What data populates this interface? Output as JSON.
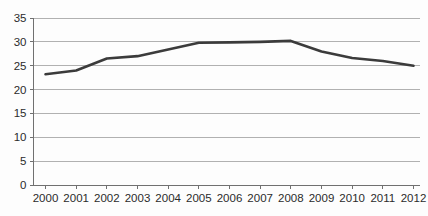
{
  "chart_data": {
    "type": "line",
    "title": "",
    "subtitle": "",
    "xlabel": "",
    "ylabel": "",
    "categories": [
      "2000",
      "2001",
      "2002",
      "2003",
      "2004",
      "2005",
      "2006",
      "2007",
      "2008",
      "2009",
      "2010",
      "2011",
      "2012"
    ],
    "x": [
      2000,
      2001,
      2002,
      2003,
      2004,
      2005,
      2006,
      2007,
      2008,
      2009,
      2010,
      2011,
      2012
    ],
    "series": [
      {
        "name": "",
        "values": [
          23.2,
          24.0,
          26.5,
          27.0,
          28.4,
          29.8,
          29.9,
          30.0,
          30.2,
          28.0,
          26.6,
          26.0,
          25.0
        ],
        "color": "#3b3b3b",
        "line_width": 2.6
      }
    ],
    "ylim": [
      0,
      35
    ],
    "yticks": [
      0,
      5,
      10,
      15,
      20,
      25,
      30,
      35
    ],
    "ytick_labels": [
      "0",
      "5",
      "10",
      "15",
      "20",
      "25",
      "30",
      "35"
    ],
    "xtick_labels": [
      "2000",
      "2001",
      "2002",
      "2003",
      "2004",
      "2005",
      "2006",
      "2007",
      "2008",
      "2009",
      "2010",
      "2011",
      "2012"
    ],
    "grid": true,
    "grid_axis": "y",
    "grid_color": "#a8a8a8",
    "legend": false,
    "legend_position": "none",
    "annotations": [],
    "background_color": "#fdfdfd",
    "axis_color": "#707070",
    "tick_label_color": "#2b2b2b"
  }
}
